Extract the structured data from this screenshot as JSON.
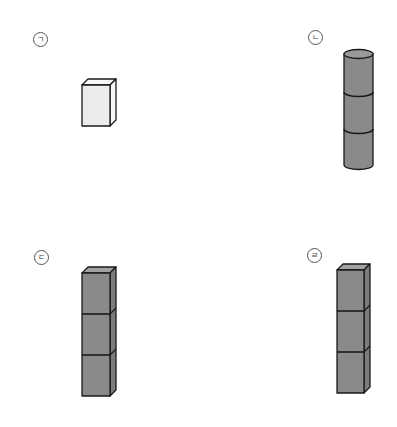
{
  "figure": {
    "items": [
      {
        "id": "a",
        "label": "ㄱ",
        "shape": "rectangular prism (box)",
        "units": 1,
        "fill": "#ececec",
        "side_fill": "#f6f6f6",
        "top_fill": "#f8f8f8"
      },
      {
        "id": "b",
        "label": "ㄴ",
        "shape": "cylinder stack",
        "units": 3,
        "fill": "#8a8a8a"
      },
      {
        "id": "c",
        "label": "ㄷ",
        "shape": "stack of cubes",
        "units": 3,
        "fill": "#8a8a8a",
        "side_fill": "#7c7c7c",
        "top_fill": "#a2a2a2"
      },
      {
        "id": "d",
        "label": "ㄹ",
        "shape": "stack of cubes",
        "units": 3,
        "fill": "#8a8a8a",
        "side_fill": "#7c7c7c",
        "top_fill": "#a2a2a2"
      }
    ]
  },
  "colors": {
    "stroke": "#1a1a1a",
    "label_stroke": "#555555"
  }
}
